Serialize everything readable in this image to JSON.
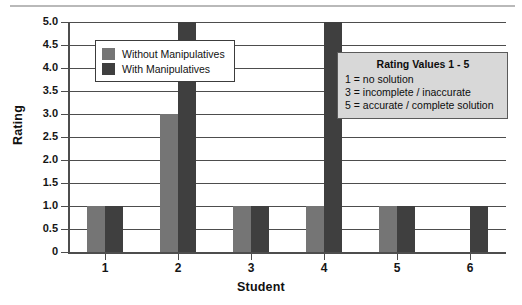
{
  "chart_data": {
    "type": "bar",
    "title": "",
    "xlabel": "Student",
    "ylabel": "Rating",
    "categories": [
      "1",
      "2",
      "3",
      "4",
      "5",
      "6"
    ],
    "series": [
      {
        "name": "Without Manipulatives",
        "color": "#757575",
        "values": [
          1,
          3,
          1,
          1,
          1,
          0
        ]
      },
      {
        "name": "With Manipulatives",
        "color": "#3f3f3f",
        "values": [
          1,
          5,
          1,
          5,
          1,
          1
        ]
      }
    ],
    "ylim": [
      0,
      5
    ],
    "ytick_labels": [
      "5.0",
      "4.5",
      "4.0",
      "3.5",
      "3.0",
      "2.5",
      "2.0",
      "1.5",
      "1.0",
      "0.5",
      "0"
    ],
    "ytick_values": [
      5.0,
      4.5,
      4.0,
      3.5,
      3.0,
      2.5,
      2.0,
      1.5,
      1.0,
      0.5,
      0
    ],
    "grid": "horizontal",
    "legend_position": "upper-left-inside",
    "annotation": {
      "title": "Rating Values 1 - 5",
      "lines": [
        "1 = no solution",
        "3 = incomplete / inaccurate",
        "5 = accurate / complete solution"
      ]
    }
  }
}
